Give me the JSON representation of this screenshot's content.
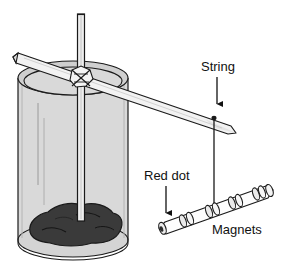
{
  "figure": {
    "labels": {
      "string": "String",
      "red_dot": "Red dot",
      "magnets": "Magnets"
    },
    "parts": {
      "container": "glass-beaker",
      "support_rod": "vertical-rod",
      "cross_stick": "horizontal-pointed-stick",
      "knot": "tie-knot",
      "anchor": "rock-clay-mass",
      "hanging_line": "string",
      "suspended_object": "bar-magnet-assembly",
      "marked_end": "red-dot-end"
    },
    "colors": {
      "outline": "#1a1a1a",
      "glass_fill": "#d9d9d9",
      "glass_highlight": "#f0f0f0",
      "rim_fill": "#cfcfcf",
      "rock_fill": "#3a3a3a",
      "rock_shadow": "#262626",
      "stick_fill": "#f2f2f2",
      "rod_fill": "#ededed",
      "magnet_fill": "#fdfdfd",
      "background": "#ffffff",
      "label_text": "#111111"
    },
    "counts": {
      "magnet_segments": 5,
      "glass_highlight_lines": 2,
      "arrows": 2
    }
  }
}
